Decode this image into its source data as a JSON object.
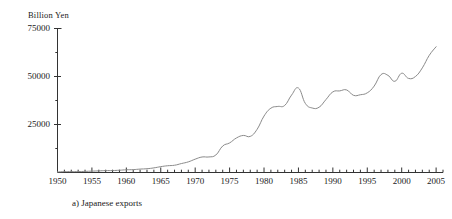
{
  "chart_data": {
    "type": "line",
    "title": "",
    "caption": "a) Japanese exports",
    "ylabel": "Billion Yen",
    "xlabel": "",
    "unit": "Billion Yen",
    "grid": false,
    "legend": "none",
    "xlim": [
      1950,
      2006
    ],
    "ylim": [
      0,
      75000
    ],
    "y_ticks_major": [
      25000,
      50000,
      75000
    ],
    "y_ticks_major_labels": [
      "25000",
      "50000",
      "75000"
    ],
    "y_ticks_minor": [
      12500,
      37500,
      62500
    ],
    "x_ticks_major": [
      1950,
      1955,
      1960,
      1965,
      1970,
      1975,
      1980,
      1985,
      1990,
      1995,
      2000,
      2005
    ],
    "x_ticks_major_labels": [
      "1950",
      "1955",
      "1960",
      "1965",
      "1970",
      "1975",
      "1980",
      "1985",
      "1990",
      "1995",
      "2000",
      "2005"
    ],
    "x_tick_minor_step": 1,
    "line_color": "#8a8a8a",
    "line_width": 1,
    "axis_color": "#333333",
    "series": [
      {
        "name": "Japanese exports",
        "x": [
          1950,
          1951,
          1952,
          1953,
          1954,
          1955,
          1956,
          1957,
          1958,
          1959,
          1960,
          1961,
          1962,
          1963,
          1964,
          1965,
          1966,
          1967,
          1968,
          1969,
          1970,
          1971,
          1972,
          1973,
          1974,
          1975,
          1976,
          1977,
          1978,
          1979,
          1980,
          1981,
          1982,
          1983,
          1984,
          1985,
          1986,
          1987,
          1988,
          1989,
          1990,
          1991,
          1992,
          1993,
          1994,
          1995,
          1996,
          1997,
          1998,
          1999,
          2000,
          2001,
          2002,
          2003,
          2004,
          2005
        ],
        "y": [
          300,
          450,
          460,
          470,
          580,
          720,
          850,
          1000,
          1020,
          1180,
          1420,
          1500,
          1780,
          1970,
          2400,
          3040,
          3520,
          3780,
          4660,
          5530,
          6950,
          8080,
          8100,
          9100,
          13800,
          15400,
          18000,
          19300,
          18800,
          22500,
          29400,
          33500,
          34400,
          34900,
          40300,
          44000,
          36000,
          33600,
          34000,
          38000,
          42000,
          42500,
          43000,
          40200,
          40500,
          41500,
          45000,
          51000,
          50600,
          47500,
          51700,
          49000,
          50000,
          54500,
          61000,
          65500
        ]
      }
    ]
  },
  "axis": {
    "y_axis_name": "value-axis",
    "x_axis_name": "year-axis"
  }
}
